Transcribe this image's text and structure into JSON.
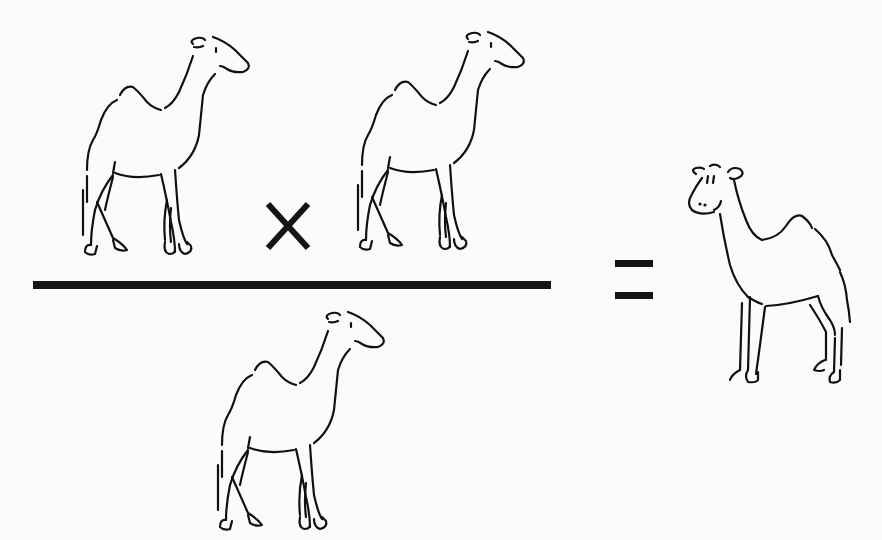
{
  "diagram": {
    "type": "equation-illustration",
    "numerator": {
      "left_operand": "dromedary camel (one hump)",
      "operator": "×",
      "right_operand": "dromedary camel (one hump)"
    },
    "denominator": "dromedary camel (one hump)",
    "equals": "=",
    "result": "smiling camel (one hump, facing left)",
    "colors": {
      "ink": "#151515",
      "background": "#fbfbfa"
    }
  }
}
